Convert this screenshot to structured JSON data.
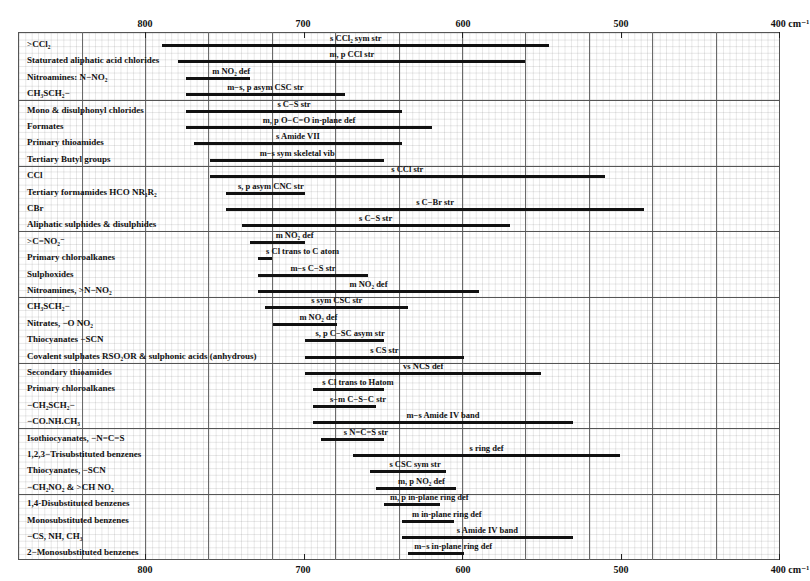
{
  "chart_data": {
    "type": "bar",
    "subtype": "horizontal-range (IR correlation chart)",
    "title": "",
    "xlabel": "cm⁻¹",
    "x_axis": {
      "ticks": [
        800,
        700,
        600,
        500,
        400
      ],
      "tick_labels": [
        "800",
        "700",
        "600",
        "500",
        "400 cm⁻¹"
      ],
      "range": [
        840,
        400
      ],
      "reversed": true
    },
    "grid": true,
    "rows": [
      {
        "label": ">CCl₂",
        "band": "s CCl₂ sym str",
        "from": 789,
        "to": 545
      },
      {
        "label": "Staturated aliphatic acid chlorides",
        "band": "m, p CCl str",
        "from": 779,
        "to": 560
      },
      {
        "label": "Nitroamines: N−NO₂",
        "band": "m NO₂ def",
        "from": 774,
        "to": 734
      },
      {
        "label": "CH₃SCH₂−",
        "band": "m−s, p  asym CSC str",
        "from": 774,
        "to": 674
      },
      {
        "label": "Mono & disulphonyl chlorides",
        "band": "s C−S str",
        "from": 774,
        "to": 638
      },
      {
        "label": "Formates",
        "band": "m, p O−C=O in-plane def",
        "from": 774,
        "to": 619
      },
      {
        "label": "Primary thioamides",
        "band": "s Amide VII",
        "from": 769,
        "to": 638
      },
      {
        "label": "Tertiary Butyl groups",
        "band": "m−s sym skeletal vib",
        "from": 759,
        "to": 649
      },
      {
        "label": "CCl",
        "band": "s  CCl str",
        "from": 759,
        "to": 510
      },
      {
        "label": "Tertiary formamides HCO NR₁R₂",
        "band": "s, p asym CNC str",
        "from": 749,
        "to": 699
      },
      {
        "label": "CBr",
        "band": "s  C−Br str",
        "from": 749,
        "to": 485
      },
      {
        "label": "Aliphatic sulphides & disulphides",
        "band": "s  C−S str",
        "from": 739,
        "to": 570
      },
      {
        "label": ">C=NO₂⁻",
        "band": "m NO₂ def",
        "from": 734,
        "to": 699
      },
      {
        "label": "Primary chloroalkanes",
        "band": "s Cl trans to C atom",
        "from": 729,
        "to": 720
      },
      {
        "label": "Sulphoxides",
        "band": "m−s  C−S str",
        "from": 729,
        "to": 659
      },
      {
        "label": "Nitroamines, >N−NO₂",
        "band": "m NO₂ def",
        "from": 729,
        "to": 589
      },
      {
        "label": "CH₃SCH₂−",
        "band": "s sym CSC str",
        "from": 724,
        "to": 634
      },
      {
        "label": "Nitrates,  −O NO₂",
        "band": "m NO₂ def",
        "from": 719,
        "to": 679
      },
      {
        "label": "Thiocyanates −SCN",
        "band": "s, p  C−SC asym str",
        "from": 699,
        "to": 649
      },
      {
        "label": "Covalent sulphates RSO₂OR & sulphonic acids (anhydrous)",
        "band": "s  CS  str",
        "from": 699,
        "to": 599
      },
      {
        "label": "Secondary thioamides",
        "band": "vs NCS def",
        "from": 699,
        "to": 550
      },
      {
        "label": "Primary chloroalkanes",
        "band": "s Cl trans to Hatom",
        "from": 694,
        "to": 649
      },
      {
        "label": "−CH₂SCH₂−",
        "band": "s−m  C−S−C  str",
        "from": 694,
        "to": 654
      },
      {
        "label": "−CO.NH.CH₃",
        "band": "m−s Amide IV band",
        "from": 694,
        "to": 530
      },
      {
        "label": "Isothiocyanates, −N=C=S",
        "band": "s  N=C=S  str",
        "from": 689,
        "to": 649
      },
      {
        "label": "1,2,3−Trisubstituted benzenes",
        "band": "s ring def",
        "from": 669,
        "to": 500
      },
      {
        "label": "Thiocyanates, −SCN",
        "band": "s CSC  sym str",
        "from": 658,
        "to": 610
      },
      {
        "label": "−CH₂NO₂ & >CH NO₂",
        "band": "m, p  NO₂ def",
        "from": 654,
        "to": 604
      },
      {
        "label": "1,4-Disubstituted benzenes",
        "band": "m, p  in-plane ring def",
        "from": 649,
        "to": 614
      },
      {
        "label": "Monosubstituted benzenes",
        "band": "m in-plane ring def",
        "from": 638,
        "to": 605
      },
      {
        "label": "−CS, NH, CH₃",
        "band": "s Amide IV band",
        "from": 638,
        "to": 530
      },
      {
        "label": "2−Monosubstituted benzenes",
        "band": "m−s  in-plane ring def",
        "from": 634,
        "to": 599
      }
    ]
  },
  "axis": {
    "top": {
      "t800": "800",
      "t700": "700",
      "t600": "600",
      "t500": "500",
      "t400": "400 cm⁻¹"
    },
    "bottom": {
      "t800": "800",
      "t700": "700",
      "t600": "600",
      "t500": "500",
      "t400": "400 cm⁻¹"
    }
  }
}
